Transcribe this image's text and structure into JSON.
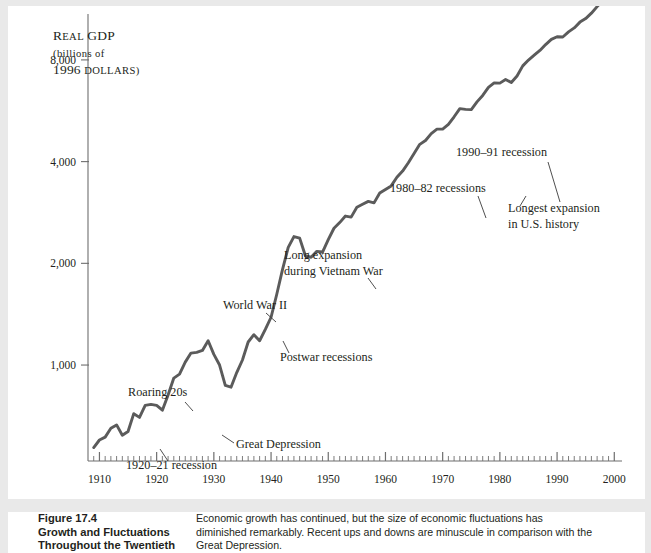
{
  "figure": {
    "caption_number": "Figure 17.4",
    "caption_title_line1": "Growth and Fluctuations",
    "caption_title_line2": "Throughout the Twentieth",
    "caption_body_line1": "Economic growth has continued, but the size of economic fluctuations has",
    "caption_body_line2": "diminished remarkably. Recent ups and downs are minuscule in comparison with the",
    "caption_body_line3": "Great Depression."
  },
  "axis": {
    "y_label_line1": "Real GDP",
    "y_label_line2": "(billions of",
    "y_label_line3": "1996 dollars)",
    "y_ticks": [
      "1,000",
      "2,000",
      "4,000",
      "8,000"
    ],
    "y_tick_values": [
      1000,
      2000,
      4000,
      8000
    ],
    "x_ticks": [
      "1910",
      "1920",
      "1930",
      "1940",
      "1950",
      "1960",
      "1970",
      "1980",
      "1990",
      "2000"
    ],
    "x_tick_values": [
      1910,
      1920,
      1930,
      1940,
      1950,
      1960,
      1970,
      1980,
      1990,
      2000
    ],
    "x_minor_tick_step": 1,
    "x_range": [
      1908,
      2001
    ],
    "y_scale": "log",
    "grid": "none",
    "line_color": "#5b5b5b",
    "axis_color": "#6e6e6e"
  },
  "annotations": [
    {
      "name": "roaring-20s",
      "lines": [
        "Roaring 20s"
      ],
      "x": 120,
      "y": 390,
      "anchor": "start",
      "leader": [
        [
          177,
          396
        ],
        [
          185,
          405
        ]
      ]
    },
    {
      "name": "recession-1920-21",
      "lines": [
        "1920–21 recession"
      ],
      "x": 118,
      "y": 463,
      "anchor": "start",
      "leader": [
        [
          160,
          455
        ],
        [
          152,
          443
        ]
      ]
    },
    {
      "name": "great-depression",
      "lines": [
        "Great Depression"
      ],
      "x": 228,
      "y": 442,
      "anchor": "start",
      "leader": [
        [
          226,
          437
        ],
        [
          214,
          429
        ]
      ]
    },
    {
      "name": "world-war-2",
      "lines": [
        "World War II"
      ],
      "x": 215,
      "y": 303,
      "anchor": "start",
      "leader": [
        [
          258,
          307
        ],
        [
          268,
          316
        ]
      ]
    },
    {
      "name": "postwar-recessions",
      "lines": [
        "Postwar recessions"
      ],
      "x": 272,
      "y": 355,
      "anchor": "start",
      "leader": [
        [
          281,
          347
        ],
        [
          275,
          335
        ]
      ]
    },
    {
      "name": "vietnam-war-expansion",
      "lines": [
        "Long expansion",
        "during Vietnam War"
      ],
      "x": 276,
      "y": 253,
      "anchor": "start",
      "leader": [
        [
          360,
          272
        ],
        [
          368,
          283
        ]
      ]
    },
    {
      "name": "recessions-1980-82",
      "lines": [
        "1980–82 recessions"
      ],
      "x": 382,
      "y": 186,
      "anchor": "start",
      "leader": [
        [
          470,
          190
        ],
        [
          478,
          212
        ]
      ]
    },
    {
      "name": "recession-1990-91",
      "lines": [
        "1990–91 recession"
      ],
      "x": 448,
      "y": 150,
      "anchor": "start",
      "leader": [
        [
          540,
          156
        ],
        [
          552,
          196
        ]
      ]
    },
    {
      "name": "longest-expansion",
      "lines": [
        "Longest expansion",
        "in U.S. history"
      ],
      "x": 500,
      "y": 206,
      "anchor": "start",
      "leader": [
        [
          512,
          200
        ],
        [
          518,
          190
        ]
      ]
    }
  ],
  "chart_data": {
    "type": "line",
    "xlabel": "",
    "ylabel": "Real GDP (billions of 1996 dollars)",
    "yscale": "log",
    "ylim": [
      520,
      10500
    ],
    "xlim": [
      1908,
      2001
    ],
    "ytick_labels": [
      "1,000",
      "2,000",
      "4,000",
      "8,000"
    ],
    "ytick_values": [
      1000,
      2000,
      4000,
      8000
    ],
    "xtick_values": [
      1910,
      1920,
      1930,
      1940,
      1950,
      1960,
      1970,
      1980,
      1990,
      2000
    ],
    "legend": "none",
    "series": [
      {
        "name": "Real GDP",
        "x": [
          1909,
          1910,
          1911,
          1912,
          1913,
          1914,
          1915,
          1916,
          1917,
          1918,
          1919,
          1920,
          1921,
          1922,
          1923,
          1924,
          1925,
          1926,
          1927,
          1928,
          1929,
          1930,
          1931,
          1932,
          1933,
          1934,
          1935,
          1936,
          1937,
          1938,
          1939,
          1940,
          1941,
          1942,
          1943,
          1944,
          1945,
          1946,
          1947,
          1948,
          1949,
          1950,
          1951,
          1952,
          1953,
          1954,
          1955,
          1956,
          1957,
          1958,
          1959,
          1960,
          1961,
          1962,
          1963,
          1964,
          1965,
          1966,
          1967,
          1968,
          1969,
          1970,
          1971,
          1972,
          1973,
          1974,
          1975,
          1976,
          1977,
          1978,
          1979,
          1980,
          1981,
          1982,
          1983,
          1984,
          1985,
          1986,
          1987,
          1988,
          1989,
          1990,
          1991,
          1992,
          1993,
          1994,
          1995,
          1996,
          1997,
          1998,
          1999,
          2000
        ],
        "y": [
          570,
          600,
          612,
          650,
          665,
          620,
          636,
          718,
          700,
          760,
          765,
          760,
          735,
          815,
          915,
          940,
          1020,
          1085,
          1090,
          1105,
          1180,
          1075,
          1000,
          870,
          860,
          950,
          1035,
          1170,
          1230,
          1180,
          1275,
          1385,
          1620,
          1915,
          2230,
          2400,
          2375,
          2105,
          2085,
          2170,
          2160,
          2350,
          2540,
          2640,
          2760,
          2740,
          2930,
          2990,
          3050,
          3020,
          3230,
          3310,
          3390,
          3595,
          3750,
          3970,
          4225,
          4500,
          4620,
          4840,
          4990,
          4995,
          5155,
          5430,
          5740,
          5710,
          5700,
          6010,
          6280,
          6630,
          6840,
          6830,
          7000,
          6860,
          7170,
          7680,
          7990,
          8260,
          8530,
          8880,
          9200,
          9370,
          9350,
          9680,
          9950,
          10350,
          10600,
          11000,
          11500,
          12000,
          12550,
          13020
        ]
      }
    ],
    "annotation_labels": [
      "Roaring 20s",
      "1920–21 recession",
      "Great Depression",
      "World War II",
      "Postwar recessions",
      "Long expansion during Vietnam War",
      "1980–82 recessions",
      "1990–91 recession",
      "Longest expansion in U.S. history"
    ]
  }
}
